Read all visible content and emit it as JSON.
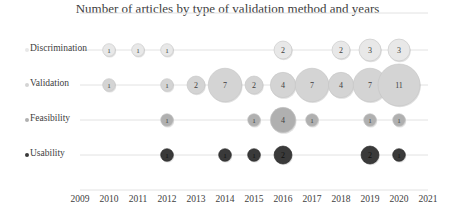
{
  "chart_data": {
    "type": "scatter",
    "subtype": "bubble",
    "title": "Number of articles by type of validation method and years",
    "xlabel": "",
    "ylabel": "",
    "xlim": [
      2009,
      2021
    ],
    "x_ticks": [
      "2009",
      "2010",
      "2011",
      "2012",
      "2013",
      "2014",
      "2015",
      "2016",
      "2017",
      "2018",
      "2019",
      "2020",
      "2021"
    ],
    "categories": [
      "Discrimination",
      "Validation",
      "Feasibility",
      "Usability"
    ],
    "grid": true,
    "legend_position": "left",
    "series": [
      {
        "name": "Discrimination",
        "color": "#e8e8e8",
        "points": [
          {
            "x": 2010,
            "value": 1
          },
          {
            "x": 2011,
            "value": 1
          },
          {
            "x": 2012,
            "value": 1
          },
          {
            "x": 2016,
            "value": 2
          },
          {
            "x": 2018,
            "value": 2
          },
          {
            "x": 2019,
            "value": 3
          },
          {
            "x": 2020,
            "value": 3
          }
        ]
      },
      {
        "name": "Validation",
        "color": "#d4d4d4",
        "points": [
          {
            "x": 2010,
            "value": 1
          },
          {
            "x": 2012,
            "value": 1
          },
          {
            "x": 2013,
            "value": 2
          },
          {
            "x": 2014,
            "value": 7
          },
          {
            "x": 2015,
            "value": 2
          },
          {
            "x": 2016,
            "value": 4
          },
          {
            "x": 2017,
            "value": 7
          },
          {
            "x": 2018,
            "value": 4
          },
          {
            "x": 2019,
            "value": 7
          },
          {
            "x": 2020,
            "value": 11
          }
        ]
      },
      {
        "name": "Feasibility",
        "color": "#b0b0b0",
        "points": [
          {
            "x": 2012,
            "value": 1
          },
          {
            "x": 2015,
            "value": 1
          },
          {
            "x": 2016,
            "value": 4
          },
          {
            "x": 2017,
            "value": 1
          },
          {
            "x": 2019,
            "value": 1
          },
          {
            "x": 2020,
            "value": 1
          }
        ]
      },
      {
        "name": "Usability",
        "color": "#3a3a3a",
        "points": [
          {
            "x": 2012,
            "value": 1
          },
          {
            "x": 2014,
            "value": 1
          },
          {
            "x": 2015,
            "value": 1
          },
          {
            "x": 2016,
            "value": 2
          },
          {
            "x": 2019,
            "value": 2
          },
          {
            "x": 2020,
            "value": 1
          }
        ]
      }
    ]
  }
}
